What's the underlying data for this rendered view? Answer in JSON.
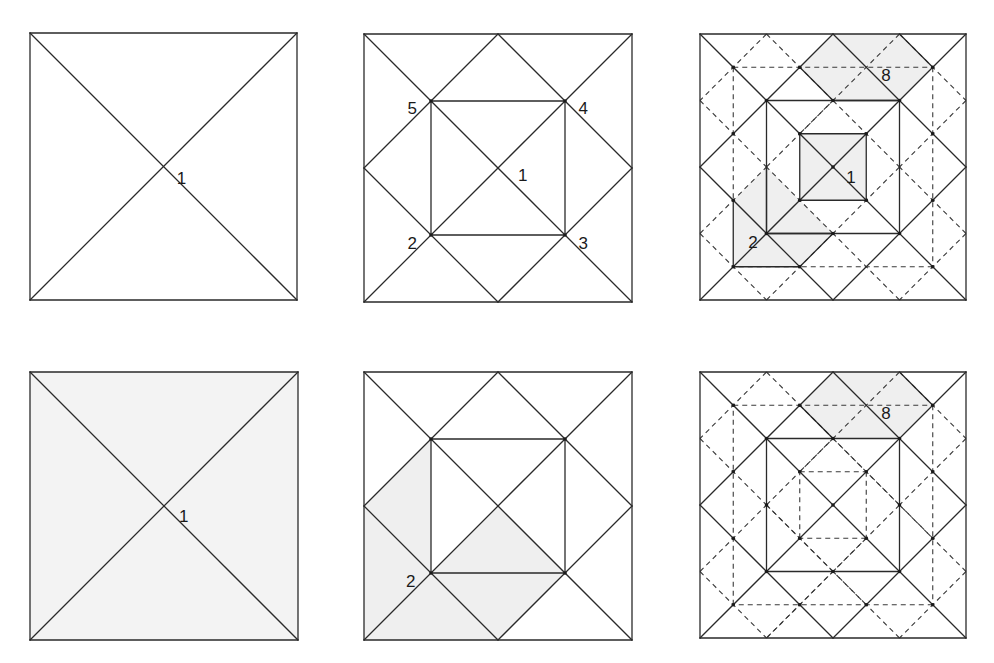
{
  "figure": {
    "colors": {
      "line": "#2a2a2a",
      "shade": "#efefef",
      "background": "#ffffff"
    },
    "panels": [
      {
        "id": "top-left",
        "x": 30,
        "y": 33,
        "size": 267,
        "background": "#ffffff",
        "shades": [],
        "solid": [
          [
            0,
            0,
            8,
            0
          ],
          [
            8,
            0,
            8,
            8
          ],
          [
            8,
            8,
            0,
            8
          ],
          [
            0,
            8,
            0,
            0
          ],
          [
            0,
            0,
            8,
            8
          ],
          [
            8,
            0,
            0,
            8
          ]
        ],
        "dashed": [],
        "dots": [],
        "labels": [
          {
            "text": "1",
            "x": 4.4,
            "y": 4.35
          }
        ]
      },
      {
        "id": "top-middle",
        "x": 364,
        "y": 34,
        "size": 268,
        "background": "#ffffff",
        "shades": [],
        "solid": [
          [
            0,
            0,
            8,
            0
          ],
          [
            8,
            0,
            8,
            8
          ],
          [
            8,
            8,
            0,
            8
          ],
          [
            0,
            8,
            0,
            0
          ],
          [
            0,
            0,
            8,
            8
          ],
          [
            8,
            0,
            0,
            8
          ],
          [
            4,
            0,
            8,
            4
          ],
          [
            8,
            4,
            4,
            8
          ],
          [
            4,
            8,
            0,
            4
          ],
          [
            0,
            4,
            4,
            0
          ],
          [
            2,
            2,
            6,
            2
          ],
          [
            6,
            2,
            6,
            6
          ],
          [
            6,
            6,
            2,
            6
          ],
          [
            2,
            6,
            2,
            2
          ]
        ],
        "dashed": [],
        "dots": [
          [
            2,
            2
          ],
          [
            6,
            2
          ],
          [
            6,
            6
          ],
          [
            2,
            6
          ]
        ],
        "labels": [
          {
            "text": "5",
            "x": 1.3,
            "y": 2.2
          },
          {
            "text": "4",
            "x": 6.4,
            "y": 2.2
          },
          {
            "text": "1",
            "x": 4.6,
            "y": 4.2
          },
          {
            "text": "2",
            "x": 1.3,
            "y": 6.25
          },
          {
            "text": "3",
            "x": 6.4,
            "y": 6.25
          }
        ]
      },
      {
        "id": "top-right",
        "x": 700,
        "y": 34,
        "size": 266,
        "background": "#ffffff",
        "shades": [
          [
            [
              4,
              0
            ],
            [
              6,
              0
            ],
            [
              7,
              1
            ],
            [
              6,
              2
            ],
            [
              4,
              2
            ],
            [
              3,
              1
            ]
          ],
          [
            [
              3,
              3
            ],
            [
              5,
              3
            ],
            [
              5,
              5
            ],
            [
              3,
              5
            ]
          ],
          [
            [
              1,
              5
            ],
            [
              2,
              4
            ],
            [
              3,
              5
            ],
            [
              4,
              6
            ],
            [
              3,
              7
            ],
            [
              1,
              7
            ]
          ]
        ],
        "solid": [
          [
            0,
            0,
            8,
            0
          ],
          [
            8,
            0,
            8,
            8
          ],
          [
            8,
            8,
            0,
            8
          ],
          [
            0,
            8,
            0,
            0
          ],
          [
            0,
            0,
            8,
            8
          ],
          [
            8,
            0,
            0,
            8
          ],
          [
            4,
            0,
            8,
            4
          ],
          [
            8,
            4,
            4,
            8
          ],
          [
            4,
            8,
            0,
            4
          ],
          [
            0,
            4,
            4,
            0
          ],
          [
            2,
            2,
            6,
            2
          ],
          [
            6,
            2,
            6,
            6
          ],
          [
            6,
            6,
            2,
            6
          ],
          [
            2,
            6,
            2,
            2
          ],
          [
            3,
            3,
            5,
            3
          ],
          [
            5,
            3,
            5,
            5
          ],
          [
            5,
            5,
            3,
            5
          ],
          [
            3,
            5,
            3,
            3
          ],
          [
            6,
            0,
            7,
            1
          ],
          [
            3,
            1,
            4,
            2
          ],
          [
            4,
            2,
            6,
            2
          ],
          [
            1,
            5,
            1,
            7
          ],
          [
            1,
            7,
            3,
            7
          ],
          [
            2,
            4,
            2,
            6
          ],
          [
            2,
            6,
            4,
            6
          ],
          [
            4,
            6,
            3,
            7
          ]
        ],
        "dashed": [
          [
            1,
            1,
            7,
            1
          ],
          [
            7,
            1,
            7,
            7
          ],
          [
            7,
            7,
            1,
            7
          ],
          [
            1,
            1,
            1,
            5
          ],
          [
            2,
            0,
            0,
            2
          ],
          [
            2,
            0,
            4,
            2
          ],
          [
            6,
            0,
            8,
            2
          ],
          [
            0,
            6,
            2,
            8
          ],
          [
            8,
            6,
            6,
            8
          ],
          [
            6,
            8,
            4,
            6
          ],
          [
            2,
            8,
            4,
            6
          ],
          [
            0,
            2,
            2,
            4
          ],
          [
            0,
            6,
            2,
            4
          ],
          [
            8,
            2,
            6,
            4
          ],
          [
            8,
            6,
            6,
            4
          ],
          [
            4,
            2,
            6,
            4
          ],
          [
            6,
            4,
            4,
            6
          ],
          [
            4,
            6,
            2,
            4
          ],
          [
            2,
            4,
            4,
            2
          ],
          [
            6,
            0,
            3,
            3
          ]
        ],
        "dots": [
          [
            1,
            1
          ],
          [
            3,
            1
          ],
          [
            7,
            1
          ],
          [
            2,
            2
          ],
          [
            4,
            2
          ],
          [
            6,
            2
          ],
          [
            3,
            3
          ],
          [
            5,
            3
          ],
          [
            4,
            4
          ],
          [
            3,
            5
          ],
          [
            5,
            5
          ],
          [
            1,
            5
          ],
          [
            2,
            6
          ],
          [
            4,
            6
          ],
          [
            6,
            6
          ],
          [
            1,
            7
          ],
          [
            3,
            7
          ],
          [
            7,
            7
          ],
          [
            7,
            3
          ],
          [
            7,
            5
          ],
          [
            1,
            3
          ]
        ],
        "labels": [
          {
            "text": "8",
            "x": 5.45,
            "y": 1.22
          },
          {
            "text": "1",
            "x": 4.4,
            "y": 4.3
          },
          {
            "text": "2",
            "x": 1.45,
            "y": 6.25
          }
        ]
      },
      {
        "id": "bottom-left",
        "x": 30,
        "y": 372,
        "size": 268,
        "background": "#f3f3f3",
        "shades": [],
        "solid": [
          [
            0,
            0,
            8,
            0
          ],
          [
            8,
            0,
            8,
            8
          ],
          [
            8,
            8,
            0,
            8
          ],
          [
            0,
            8,
            0,
            0
          ],
          [
            0,
            0,
            8,
            8
          ],
          [
            8,
            0,
            0,
            8
          ]
        ],
        "dashed": [],
        "dots": [],
        "labels": [
          {
            "text": "1",
            "x": 4.45,
            "y": 4.3
          }
        ]
      },
      {
        "id": "bottom-middle",
        "x": 364,
        "y": 372,
        "size": 268,
        "background": "#ffffff",
        "shades": [
          [
            [
              0,
              4
            ],
            [
              2,
              2
            ],
            [
              2,
              6
            ],
            [
              4,
              4
            ],
            [
              6,
              6
            ],
            [
              4,
              8
            ],
            [
              0,
              8
            ]
          ]
        ],
        "solid": [
          [
            0,
            0,
            8,
            0
          ],
          [
            8,
            0,
            8,
            8
          ],
          [
            8,
            8,
            0,
            8
          ],
          [
            0,
            8,
            0,
            0
          ],
          [
            0,
            0,
            8,
            8
          ],
          [
            8,
            0,
            0,
            8
          ],
          [
            4,
            0,
            8,
            4
          ],
          [
            8,
            4,
            4,
            8
          ],
          [
            4,
            8,
            0,
            4
          ],
          [
            0,
            4,
            4,
            0
          ],
          [
            2,
            2,
            6,
            2
          ],
          [
            6,
            2,
            6,
            6
          ],
          [
            6,
            6,
            2,
            6
          ],
          [
            2,
            6,
            2,
            2
          ]
        ],
        "dashed": [],
        "dots": [
          [
            2,
            2
          ],
          [
            6,
            2
          ],
          [
            6,
            6
          ],
          [
            2,
            6
          ]
        ],
        "labels": [
          {
            "text": "2",
            "x": 1.25,
            "y": 6.25
          }
        ]
      },
      {
        "id": "bottom-right",
        "x": 700,
        "y": 372,
        "size": 266,
        "background": "#ffffff",
        "shades": [
          [
            [
              4,
              0
            ],
            [
              6,
              0
            ],
            [
              7,
              1
            ],
            [
              6,
              2
            ],
            [
              4,
              2
            ],
            [
              3,
              1
            ]
          ]
        ],
        "solid": [
          [
            0,
            0,
            8,
            0
          ],
          [
            8,
            0,
            8,
            8
          ],
          [
            8,
            8,
            0,
            8
          ],
          [
            0,
            8,
            0,
            0
          ],
          [
            0,
            0,
            8,
            8
          ],
          [
            8,
            0,
            0,
            8
          ],
          [
            4,
            0,
            8,
            4
          ],
          [
            8,
            4,
            4,
            8
          ],
          [
            4,
            8,
            0,
            4
          ],
          [
            0,
            4,
            4,
            0
          ],
          [
            2,
            2,
            6,
            2
          ],
          [
            6,
            2,
            6,
            6
          ],
          [
            6,
            6,
            2,
            6
          ],
          [
            2,
            6,
            2,
            2
          ],
          [
            6,
            0,
            7,
            1
          ],
          [
            3,
            1,
            4,
            2
          ]
        ],
        "dashed": [
          [
            1,
            1,
            7,
            1
          ],
          [
            7,
            1,
            7,
            7
          ],
          [
            7,
            7,
            1,
            7
          ],
          [
            1,
            7,
            1,
            1
          ],
          [
            3,
            3,
            5,
            3
          ],
          [
            5,
            3,
            5,
            5
          ],
          [
            5,
            5,
            3,
            5
          ],
          [
            3,
            5,
            3,
            3
          ],
          [
            2,
            0,
            0,
            2
          ],
          [
            2,
            0,
            4,
            2
          ],
          [
            6,
            0,
            8,
            2
          ],
          [
            0,
            6,
            2,
            8
          ],
          [
            8,
            6,
            6,
            8
          ],
          [
            6,
            8,
            4,
            6
          ],
          [
            2,
            8,
            4,
            6
          ],
          [
            0,
            2,
            2,
            4
          ],
          [
            0,
            6,
            2,
            4
          ],
          [
            8,
            2,
            6,
            4
          ],
          [
            8,
            6,
            6,
            4
          ],
          [
            4,
            2,
            6,
            4
          ],
          [
            6,
            4,
            4,
            6
          ],
          [
            4,
            6,
            2,
            4
          ],
          [
            2,
            4,
            4,
            2
          ],
          [
            6,
            0,
            3,
            3
          ],
          [
            5,
            5,
            2,
            8
          ],
          [
            2,
            4,
            5,
            7
          ],
          [
            3,
            1,
            7,
            5
          ]
        ],
        "dots": [
          [
            1,
            1
          ],
          [
            3,
            1
          ],
          [
            7,
            1
          ],
          [
            2,
            2
          ],
          [
            4,
            2
          ],
          [
            6,
            2
          ],
          [
            3,
            3
          ],
          [
            5,
            3
          ],
          [
            4,
            4
          ],
          [
            3,
            5
          ],
          [
            5,
            5
          ],
          [
            1,
            5
          ],
          [
            2,
            6
          ],
          [
            4,
            6
          ],
          [
            6,
            6
          ],
          [
            1,
            7
          ],
          [
            3,
            7
          ],
          [
            7,
            7
          ],
          [
            7,
            3
          ],
          [
            7,
            5
          ],
          [
            1,
            3
          ],
          [
            5,
            7
          ],
          [
            2,
            4
          ],
          [
            6,
            4
          ]
        ],
        "labels": [
          {
            "text": "8",
            "x": 5.45,
            "y": 1.22
          }
        ]
      }
    ]
  }
}
